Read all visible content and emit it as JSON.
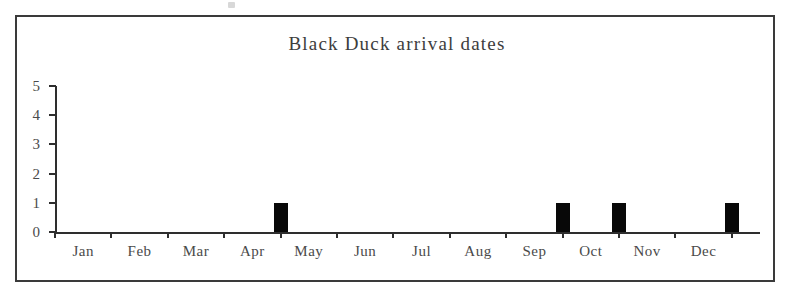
{
  "chart_data": {
    "type": "bar",
    "title": "Black Duck arrival dates",
    "xlabel": "",
    "ylabel": "",
    "categories": [
      "Jan",
      "Feb",
      "Mar",
      "Apr",
      "May",
      "Jun",
      "Jul",
      "Aug",
      "Sep",
      "Oct",
      "Nov",
      "Dec"
    ],
    "values": [
      0,
      0,
      0,
      1,
      0,
      0,
      0,
      0,
      1,
      1,
      0,
      1
    ],
    "ylim": [
      0,
      5
    ],
    "yticks": [
      "0",
      "1",
      "2",
      "3",
      "4",
      "5"
    ],
    "grid": false,
    "legend": null,
    "bar_color": "#080808",
    "axis_color": "#2e2e2e",
    "text_color": "#4a4a4a",
    "background": "#ffffff",
    "border_color": "#3a3a3a"
  }
}
